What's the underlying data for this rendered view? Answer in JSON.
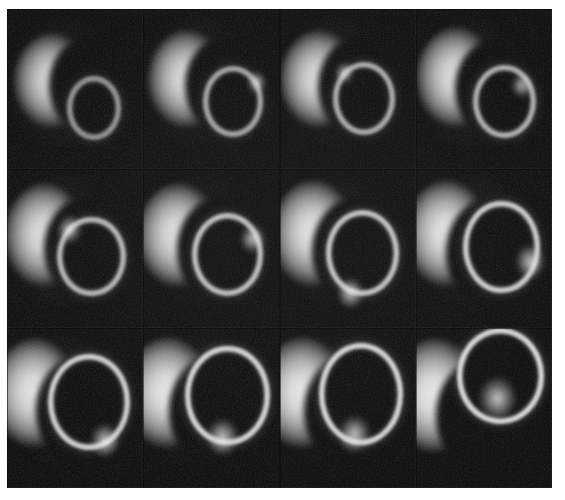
{
  "figure": {
    "background_color": "#ffffff",
    "plate_color": "#000000",
    "grid": {
      "rows": 3,
      "columns": 4,
      "total_frames": 12
    },
    "plate": {
      "left": 7,
      "top": 9,
      "width": 545,
      "height": 479
    }
  },
  "frames": [
    {
      "id": "frame-r1c1",
      "row": 1,
      "column": 1,
      "label": "",
      "crescent": {
        "cx": 38,
        "cy": 48,
        "r": 34,
        "cut_cx": 62,
        "cut_cy": 48,
        "cut_r": 31
      },
      "oval": {
        "cx": 64,
        "cy": 62,
        "rx": 20,
        "ry": 20,
        "ring_brightness": 0.62,
        "hotspot": null
      },
      "brightness": 0.7
    },
    {
      "id": "frame-r1c2",
      "row": 1,
      "column": 2,
      "label": "",
      "crescent": {
        "cx": 37,
        "cy": 47,
        "r": 35,
        "cut_cx": 62,
        "cut_cy": 48,
        "cut_r": 31
      },
      "oval": {
        "cx": 66,
        "cy": 58,
        "rx": 22,
        "ry": 22,
        "ring_brightness": 0.7,
        "hotspot": {
          "cx": 83,
          "cy": 46,
          "r": 7
        }
      },
      "brightness": 0.74
    },
    {
      "id": "frame-r1c3",
      "row": 1,
      "column": 3,
      "label": "",
      "crescent": {
        "cx": 34,
        "cy": 47,
        "r": 35,
        "cut_cx": 60,
        "cut_cy": 49,
        "cut_r": 32
      },
      "oval": {
        "cx": 62,
        "cy": 56,
        "rx": 23,
        "ry": 23,
        "ring_brightness": 0.74,
        "hotspot": {
          "cx": 48,
          "cy": 40,
          "r": 7
        }
      },
      "brightness": 0.76
    },
    {
      "id": "frame-r1c4",
      "row": 1,
      "column": 4,
      "label": "",
      "crescent": {
        "cx": 35,
        "cy": 46,
        "r": 36,
        "cut_cx": 61,
        "cut_cy": 50,
        "cut_r": 32
      },
      "oval": {
        "cx": 65,
        "cy": 58,
        "rx": 23,
        "ry": 23,
        "ring_brightness": 0.76,
        "hotspot": {
          "cx": 78,
          "cy": 48,
          "r": 8
        }
      },
      "brightness": 0.78
    },
    {
      "id": "frame-r2c1",
      "row": 2,
      "column": 1,
      "label": "",
      "crescent": {
        "cx": 33,
        "cy": 45,
        "r": 37,
        "cut_cx": 60,
        "cut_cy": 50,
        "cut_r": 33
      },
      "oval": {
        "cx": 62,
        "cy": 55,
        "rx": 25,
        "ry": 25,
        "ring_brightness": 0.8,
        "hotspot": {
          "cx": 46,
          "cy": 38,
          "r": 9
        }
      },
      "brightness": 0.8
    },
    {
      "id": "frame-r2c2",
      "row": 2,
      "column": 2,
      "label": "",
      "crescent": {
        "cx": 31,
        "cy": 45,
        "r": 37,
        "cut_cx": 59,
        "cut_cy": 51,
        "cut_r": 34
      },
      "oval": {
        "cx": 62,
        "cy": 54,
        "rx": 26,
        "ry": 26,
        "ring_brightness": 0.84,
        "hotspot": {
          "cx": 80,
          "cy": 44,
          "r": 9
        }
      },
      "brightness": 0.82
    },
    {
      "id": "frame-r2c3",
      "row": 2,
      "column": 3,
      "label": "",
      "crescent": {
        "cx": 30,
        "cy": 44,
        "r": 38,
        "cut_cx": 58,
        "cut_cy": 52,
        "cut_r": 34
      },
      "oval": {
        "cx": 61,
        "cy": 53,
        "rx": 27,
        "ry": 27,
        "ring_brightness": 0.86,
        "hotspot": {
          "cx": 52,
          "cy": 78,
          "r": 10
        }
      },
      "brightness": 0.84
    },
    {
      "id": "frame-r2c4",
      "row": 2,
      "column": 4,
      "label": "",
      "crescent": {
        "cx": 28,
        "cy": 44,
        "r": 38,
        "cut_cx": 57,
        "cut_cy": 53,
        "cut_r": 35
      },
      "oval": {
        "cx": 63,
        "cy": 49,
        "rx": 28,
        "ry": 29,
        "ring_brightness": 0.9,
        "hotspot": {
          "cx": 84,
          "cy": 58,
          "r": 11
        }
      },
      "brightness": 0.86
    },
    {
      "id": "frame-r3c1",
      "row": 3,
      "column": 1,
      "label": "",
      "crescent": {
        "cx": 26,
        "cy": 44,
        "r": 39,
        "cut_cx": 56,
        "cut_cy": 52,
        "cut_r": 35
      },
      "oval": {
        "cx": 60,
        "cy": 46,
        "rx": 30,
        "ry": 30,
        "ring_brightness": 0.92,
        "hotspot": {
          "cx": 72,
          "cy": 70,
          "r": 11
        }
      },
      "brightness": 0.88
    },
    {
      "id": "frame-r3c2",
      "row": 3,
      "column": 2,
      "label": "",
      "crescent": {
        "cx": 24,
        "cy": 44,
        "r": 40,
        "cut_cx": 55,
        "cut_cy": 52,
        "cut_r": 36
      },
      "oval": {
        "cx": 62,
        "cy": 42,
        "rx": 31,
        "ry": 31,
        "ring_brightness": 0.94,
        "hotspot": {
          "cx": 58,
          "cy": 68,
          "r": 12
        }
      },
      "brightness": 0.9
    },
    {
      "id": "frame-r3c3",
      "row": 3,
      "column": 3,
      "label": "",
      "crescent": {
        "cx": 23,
        "cy": 44,
        "r": 40,
        "cut_cx": 54,
        "cut_cy": 52,
        "cut_r": 36
      },
      "oval": {
        "cx": 60,
        "cy": 41,
        "rx": 31,
        "ry": 32,
        "ring_brightness": 0.95,
        "hotspot": {
          "cx": 55,
          "cy": 66,
          "r": 12
        }
      },
      "brightness": 0.91
    },
    {
      "id": "frame-r3c4",
      "row": 3,
      "column": 4,
      "label": "",
      "crescent": {
        "cx": 20,
        "cy": 46,
        "r": 41,
        "cut_cx": 52,
        "cut_cy": 55,
        "cut_r": 37
      },
      "oval": {
        "cx": 62,
        "cy": 30,
        "rx": 32,
        "ry": 30,
        "ring_brightness": 0.97,
        "hotspot": {
          "cx": 60,
          "cy": 44,
          "r": 14
        }
      },
      "brightness": 0.93
    }
  ],
  "colors": {
    "page_background": "#ffffff",
    "plate_background": "#000000",
    "highlight": "#f2f2f2",
    "midtone": "#b5b5b5",
    "shadow": "#3a3a3a"
  }
}
